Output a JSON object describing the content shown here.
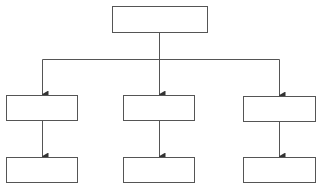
{
  "diagram": {
    "type": "hierarchy",
    "stroke_color": "#555555",
    "background": "#ffffff",
    "nodes": [
      {
        "id": "root",
        "label": "",
        "x": 112.5,
        "y": 6.5,
        "w": 95,
        "h": 26
      },
      {
        "id": "mid-left",
        "label": "",
        "x": 6.5,
        "y": 95.5,
        "w": 71,
        "h": 25
      },
      {
        "id": "mid-center",
        "label": "",
        "x": 123.5,
        "y": 95.5,
        "w": 71,
        "h": 25
      },
      {
        "id": "mid-right",
        "label": "",
        "x": 243.5,
        "y": 96.5,
        "w": 72,
        "h": 25
      },
      {
        "id": "bottom-left",
        "label": "",
        "x": 6.5,
        "y": 157.5,
        "w": 71,
        "h": 25
      },
      {
        "id": "bottom-center",
        "label": "",
        "x": 123.5,
        "y": 157.5,
        "w": 71,
        "h": 25
      },
      {
        "id": "bottom-right",
        "label": "",
        "x": 243.5,
        "y": 157.5,
        "w": 72,
        "h": 25
      }
    ],
    "edges": [
      {
        "from": "root",
        "to": "mid-left"
      },
      {
        "from": "root",
        "to": "mid-center"
      },
      {
        "from": "root",
        "to": "mid-right"
      },
      {
        "from": "mid-left",
        "to": "bottom-left"
      },
      {
        "from": "mid-center",
        "to": "bottom-center"
      },
      {
        "from": "mid-right",
        "to": "bottom-right"
      }
    ]
  }
}
